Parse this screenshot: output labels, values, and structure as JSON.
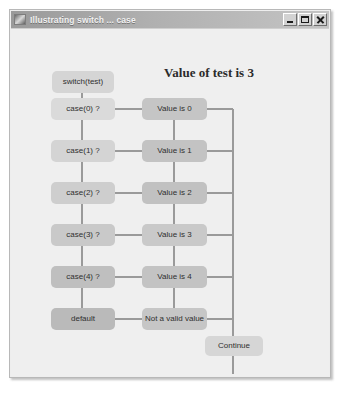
{
  "window": {
    "title": "Illustrating switch ... case",
    "icon": "app-icon",
    "controls": [
      {
        "name": "minimize",
        "glyph": "minimize-icon"
      },
      {
        "name": "maximize",
        "glyph": "maximize-icon"
      },
      {
        "name": "close",
        "glyph": "close-icon"
      }
    ]
  },
  "heading": "Value of test is 3",
  "switch_button": "switch(test)",
  "continue_button": "Continue",
  "rows": [
    {
      "case": "case(0) ?",
      "value": "Value is 0"
    },
    {
      "case": "case(1) ?",
      "value": "Value is 1"
    },
    {
      "case": "case(2) ?",
      "value": "Value is 2"
    },
    {
      "case": "case(3) ?",
      "value": "Value is 3"
    },
    {
      "case": "case(4) ?",
      "value": "Value is 4"
    },
    {
      "case": "default",
      "value": "Not a valid value"
    }
  ],
  "colors": {
    "window_background": "#efefef",
    "title_bar": "#b0b0b0",
    "node_light": "#d9d9d9",
    "node_mid": "#c8c8c8",
    "node_dark": "#b9b9b9",
    "connector": "#9a9a9a",
    "text": "#2f2f2f"
  }
}
